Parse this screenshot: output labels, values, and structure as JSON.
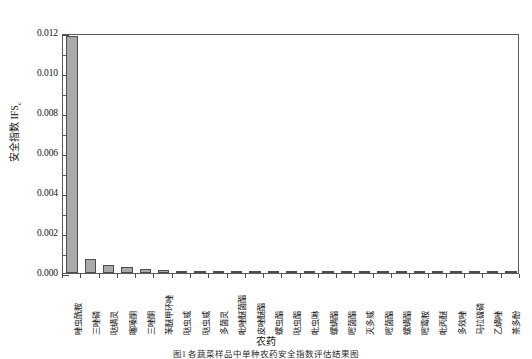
{
  "chart_data": {
    "type": "bar",
    "title": "",
    "xlabel": "农药",
    "ylabel": "安全指数 IFS",
    "ylabel_subscript": "c",
    "ylim": [
      0,
      0.012
    ],
    "ytick_labels": [
      "0.000",
      "0.002",
      "0.004",
      "0.006",
      "0.008",
      "0.010",
      "0.012"
    ],
    "ytick_values": [
      0,
      0.002,
      0.004,
      0.006,
      0.008,
      0.01,
      0.012
    ],
    "minor_ticks": true,
    "grid": false,
    "legend": "none",
    "bar_color": "#a9a9a9",
    "bar_edge_color": "#4d4d4d",
    "axis_color": "#5a5a5a",
    "categories": [
      "唑虫酰胺",
      "三唑磷",
      "哒螨灵",
      "噻嗪酮",
      "三唑酮",
      "苯醚甲环唑",
      "哒虫威",
      "哒虫威",
      "多菌灵",
      "吡唑醚菌酯",
      "皮唑醚酯",
      "螺虫酯",
      "哒虫酯",
      "吡虫啉",
      "螺螨酯",
      "嘧菌酯",
      "灭多威",
      "嘧菌酯",
      "螺螨酯",
      "嘧霉胺",
      "吡丙醚",
      "多效唑",
      "马拉硫磷",
      "乙螨唑",
      "茶多酚"
    ],
    "values": [
      0.01185,
      0.00068,
      0.00042,
      0.00031,
      0.00022,
      0.00014,
      0.00011,
      9e-05,
      8e-05,
      7e-05,
      6e-05,
      6e-05,
      5e-05,
      5e-05,
      4e-05,
      4e-05,
      3e-05,
      3e-05,
      3e-05,
      2e-05,
      2e-05,
      2e-05,
      1e-05,
      1e-05,
      1e-05
    ],
    "caption": "图1  各蔬菜样品中单种农药安全指数评估结果图"
  }
}
